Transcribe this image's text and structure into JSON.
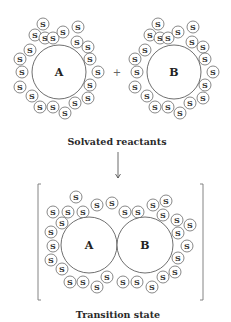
{
  "diagram": {
    "reactants": {
      "caption": "Solvated reactants",
      "operator": "+",
      "molecule_a": {
        "label": "A",
        "cx": 59,
        "cy": 72,
        "r": 27
      },
      "molecule_b": {
        "label": "B",
        "cx": 174,
        "cy": 72,
        "r": 27
      },
      "solvent_label": "S",
      "solvent_radius": 6,
      "solvent_a": [
        [
          43,
          24
        ],
        [
          35,
          35
        ],
        [
          45,
          38
        ],
        [
          53,
          38
        ],
        [
          63,
          32
        ],
        [
          78,
          27
        ],
        [
          77,
          42
        ],
        [
          88,
          47
        ],
        [
          30,
          50
        ],
        [
          20,
          59
        ],
        [
          90,
          59
        ],
        [
          98,
          72
        ],
        [
          22,
          72
        ],
        [
          90,
          85
        ],
        [
          20,
          87
        ],
        [
          88,
          98
        ],
        [
          32,
          96
        ],
        [
          75,
          103
        ],
        [
          40,
          107
        ],
        [
          53,
          107
        ],
        [
          65,
          113
        ]
      ],
      "solvent_b_offset_x": 115
    },
    "arrow": {
      "x": 118,
      "y1": 152,
      "y2": 178,
      "direction": "down"
    },
    "transition_state": {
      "caption": "Transition state",
      "molecule_a": {
        "label": "A",
        "cx": 89,
        "cy": 245,
        "r": 28
      },
      "molecule_b": {
        "label": "B",
        "cx": 145,
        "cy": 245,
        "r": 28
      },
      "solvent_label": "S",
      "solvent_radius": 6,
      "solvent": [
        [
          76,
          197
        ],
        [
          53,
          212
        ],
        [
          68,
          212
        ],
        [
          83,
          212
        ],
        [
          97,
          205
        ],
        [
          112,
          203
        ],
        [
          125,
          212
        ],
        [
          138,
          212
        ],
        [
          153,
          205
        ],
        [
          166,
          201
        ],
        [
          62,
          223
        ],
        [
          163,
          215
        ],
        [
          177,
          220
        ],
        [
          190,
          225
        ],
        [
          51,
          232
        ],
        [
          178,
          233
        ],
        [
          53,
          246
        ],
        [
          187,
          246
        ],
        [
          51,
          260
        ],
        [
          178,
          258
        ],
        [
          62,
          269
        ],
        [
          175,
          272
        ],
        [
          70,
          282
        ],
        [
          83,
          282
        ],
        [
          97,
          287
        ],
        [
          107,
          277
        ],
        [
          123,
          282
        ],
        [
          137,
          282
        ],
        [
          152,
          287
        ],
        [
          163,
          277
        ]
      ],
      "brackets": {
        "left_x": 38,
        "right_x": 203,
        "top_y": 184,
        "bottom_y": 300
      }
    }
  }
}
